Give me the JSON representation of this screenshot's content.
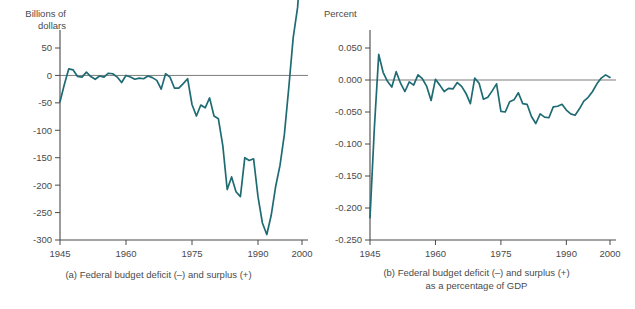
{
  "figure": {
    "background": "#ffffff",
    "line_color": "#1f6b73",
    "axis_color": "#4a4a4a",
    "text_color": "#4a4a4a"
  },
  "panel_a": {
    "y_axis_title": "Billions of\ndollars",
    "caption": "(a) Federal budget deficit (–) and surplus (+)",
    "y_ticks": [
      "50",
      "0",
      "-50",
      "-100",
      "-150",
      "-200",
      "-250",
      "-300"
    ],
    "x_ticks": [
      "1945",
      "1960",
      "1975",
      "1990",
      "2000"
    ]
  },
  "panel_b": {
    "y_axis_title": "Percent",
    "caption_line1": "(b) Federal budget deficit (–) and surplus (+)",
    "caption_line2": "as a percentage of GDP",
    "y_ticks": [
      "0.050",
      "0.000",
      "-0.050",
      "-0.100",
      "-0.150",
      "-0.200",
      "-0.250"
    ],
    "x_ticks": [
      "1945",
      "1960",
      "1975",
      "1990",
      "2000"
    ]
  },
  "chart_data": [
    {
      "type": "line",
      "id": "panel-a",
      "title": "(a) Federal budget deficit (–) and surplus (+)",
      "xlabel": "",
      "ylabel": "Billions of dollars",
      "xlim": [
        1945,
        2000
      ],
      "ylim": [
        -300,
        50
      ],
      "yticks": [
        50,
        0,
        -50,
        -100,
        -150,
        -200,
        -250,
        -300
      ],
      "xticks": [
        1945,
        1960,
        1975,
        1990,
        2000
      ],
      "grid": false,
      "legend": "none",
      "zero_reference_line": 0,
      "note": "Final 2000 value rises above the top of the plotted axis range",
      "series": [
        {
          "name": "Federal budget surplus/deficit",
          "color": "#1f6b73",
          "x": [
            1945,
            1946,
            1947,
            1948,
            1949,
            1950,
            1951,
            1952,
            1953,
            1954,
            1955,
            1956,
            1957,
            1958,
            1959,
            1960,
            1961,
            1962,
            1963,
            1964,
            1965,
            1966,
            1967,
            1968,
            1969,
            1970,
            1971,
            1972,
            1973,
            1974,
            1975,
            1976,
            1977,
            1978,
            1979,
            1980,
            1981,
            1982,
            1983,
            1984,
            1985,
            1986,
            1987,
            1988,
            1989,
            1990,
            1991,
            1992,
            1993,
            1994,
            1995,
            1996,
            1997,
            1998,
            1999,
            2000
          ],
          "values": [
            -48,
            -16,
            12,
            10,
            -2,
            -3,
            6,
            -2,
            -7,
            -1,
            -3,
            4,
            3,
            -3,
            -13,
            0,
            -3,
            -7,
            -5,
            -6,
            -1,
            -4,
            -9,
            -25,
            3,
            -3,
            -23,
            -23,
            -15,
            -6,
            -53,
            -74,
            -54,
            -59,
            -41,
            -74,
            -79,
            -128,
            -208,
            -185,
            -212,
            -221,
            -150,
            -155,
            -152,
            -221,
            -269,
            -290,
            -255,
            -203,
            -164,
            -107,
            -22,
            69,
            124,
            236
          ]
        }
      ]
    },
    {
      "type": "line",
      "id": "panel-b",
      "title": "(b) Federal budget deficit (–) and surplus (+) as a percentage of GDP",
      "xlabel": "",
      "ylabel": "Percent",
      "xlim": [
        1945,
        2000
      ],
      "ylim": [
        -0.25,
        0.05
      ],
      "yticks": [
        0.05,
        0.0,
        -0.05,
        -0.1,
        -0.15,
        -0.2,
        -0.25
      ],
      "xticks": [
        1945,
        1960,
        1975,
        1990,
        2000
      ],
      "grid": false,
      "legend": "none",
      "zero_reference_line": 0,
      "series": [
        {
          "name": "Federal budget surplus/deficit as percent of GDP",
          "color": "#1f6b73",
          "x": [
            1945,
            1946,
            1947,
            1948,
            1949,
            1950,
            1951,
            1952,
            1953,
            1954,
            1955,
            1956,
            1957,
            1958,
            1959,
            1960,
            1961,
            1962,
            1963,
            1964,
            1965,
            1966,
            1967,
            1968,
            1969,
            1970,
            1971,
            1972,
            1973,
            1974,
            1975,
            1976,
            1977,
            1978,
            1979,
            1980,
            1981,
            1982,
            1983,
            1984,
            1985,
            1986,
            1987,
            1988,
            1989,
            1990,
            1991,
            1992,
            1993,
            1994,
            1995,
            1996,
            1997,
            1998,
            1999,
            2000
          ],
          "values": [
            -0.215,
            -0.075,
            0.04,
            0.012,
            -0.002,
            -0.011,
            0.013,
            -0.005,
            -0.018,
            -0.003,
            -0.008,
            0.008,
            0.002,
            -0.01,
            -0.032,
            0.001,
            -0.008,
            -0.018,
            -0.013,
            -0.014,
            -0.004,
            -0.01,
            -0.021,
            -0.037,
            0.003,
            -0.005,
            -0.03,
            -0.027,
            -0.017,
            -0.006,
            -0.049,
            -0.05,
            -0.034,
            -0.031,
            -0.02,
            -0.037,
            -0.038,
            -0.057,
            -0.068,
            -0.053,
            -0.058,
            -0.059,
            -0.042,
            -0.041,
            -0.038,
            -0.047,
            -0.053,
            -0.055,
            -0.045,
            -0.033,
            -0.027,
            -0.018,
            -0.006,
            0.003,
            0.008,
            0.004
          ]
        }
      ]
    }
  ]
}
